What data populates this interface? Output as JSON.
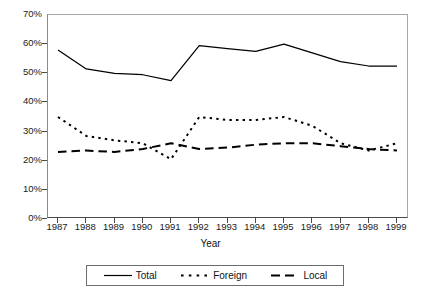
{
  "chart_data": {
    "type": "line",
    "title": "",
    "xlabel": "Year",
    "ylabel": "",
    "categories": [
      "1987",
      "1988",
      "1989",
      "1990",
      "1991",
      "1992",
      "1993",
      "1994",
      "1995",
      "1996",
      "1997",
      "1998",
      "1999"
    ],
    "ylim": [
      0,
      70
    ],
    "ytick_labels": [
      "0%",
      "10%",
      "20%",
      "30%",
      "40%",
      "50%",
      "60%",
      "70%"
    ],
    "ytick_values": [
      0,
      10,
      20,
      30,
      40,
      50,
      60,
      70
    ],
    "grid": false,
    "legend_position": "bottom",
    "series": [
      {
        "name": "Total",
        "style": "solid",
        "color": "#000000",
        "values": [
          58,
          51.5,
          50,
          49.5,
          47.5,
          59.5,
          58.5,
          57.5,
          60,
          57,
          54,
          52.5,
          52.5
        ]
      },
      {
        "name": "Foreign",
        "style": "dotted",
        "color": "#000000",
        "values": [
          35,
          28.5,
          27,
          26,
          20.5,
          35,
          34,
          34,
          35,
          32,
          26,
          23.5,
          26
        ]
      },
      {
        "name": "Local",
        "style": "dashed",
        "color": "#000000",
        "values": [
          23,
          23.5,
          23,
          24,
          26,
          24,
          24.5,
          25.5,
          26,
          26,
          25,
          24,
          23.5
        ]
      }
    ]
  },
  "axis": {
    "x_title": "Year"
  },
  "legend": {
    "items": [
      {
        "label": "Total"
      },
      {
        "label": "Foreign"
      },
      {
        "label": "Local"
      }
    ]
  },
  "caption": ""
}
